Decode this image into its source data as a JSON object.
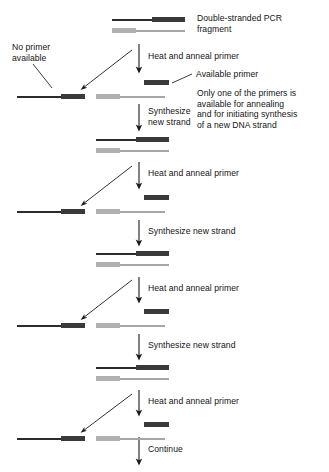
{
  "diagram": {
    "colors": {
      "template_strand": "#2b2b2b",
      "complementary_strand": "#a6a6a6",
      "primer_dark": "#3a3a3a",
      "primer_gray": "#b0b0b0",
      "background": "#ffffff",
      "text": "#141414"
    },
    "annotations": {
      "double_stranded": "Double-stranded PCR\nfragment",
      "no_primer": "No primer\navailable",
      "available_primer": "Available primer",
      "only_one_primer": "Only one of the primers is\navailable for annealing\nand for initiating synthesis\nof a new DNA strand"
    },
    "steps": [
      {
        "label": "Heat and anneal primer"
      },
      {
        "label": "Synthesize\nnew strand"
      },
      {
        "label": "Heat and anneal primer"
      },
      {
        "label": "Synthesize new strand"
      },
      {
        "label": "Heat and anneal primer"
      },
      {
        "label": "Synthesize new strand"
      },
      {
        "label": "Heat and anneal primer"
      },
      {
        "label": "Continue"
      }
    ],
    "rows": [
      {
        "type": "double-stranded-fragment",
        "caption": "Double-stranded PCR fragment"
      },
      {
        "type": "separated-strands-with-primer",
        "caption": "No primer available / Available primer"
      },
      {
        "type": "double-stranded-fragment",
        "caption": ""
      },
      {
        "type": "separated-strands-with-primer",
        "caption": ""
      },
      {
        "type": "double-stranded-fragment",
        "caption": ""
      },
      {
        "type": "separated-strands-with-primer",
        "caption": ""
      },
      {
        "type": "double-stranded-fragment",
        "caption": ""
      },
      {
        "type": "separated-strands-with-primer",
        "caption": ""
      }
    ]
  }
}
